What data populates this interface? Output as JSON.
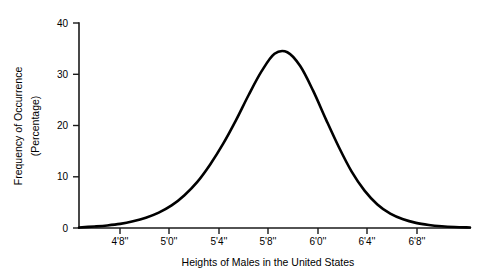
{
  "chart_data": {
    "type": "line",
    "title": "",
    "subtitle": "",
    "xlabel": "Heights of Males in the United States",
    "ylabel": "Frequency of Occurrence (Percentage)",
    "ylabel_lines": [
      "Frequency of Occurrence",
      "(Percentage)"
    ],
    "x_tick_labels": [
      "4'8''",
      "5'0''",
      "5'4''",
      "5'8''",
      "6'0''",
      "6'4''",
      "6'8''"
    ],
    "x_tick_values": [
      56,
      60,
      64,
      68,
      72,
      76,
      80
    ],
    "x_tick_unit": "inches",
    "y_tick_labels": [
      "0",
      "10",
      "20",
      "30",
      "40"
    ],
    "y_tick_values": [
      0,
      10,
      20,
      30,
      40
    ],
    "xlim": [
      52.8,
      83.2
    ],
    "ylim": [
      0,
      40
    ],
    "grid": false,
    "legend": false,
    "legend_position": "none",
    "distribution": "normal",
    "peak_x_label": "5'8''",
    "peak_value": 34.3,
    "series": [
      {
        "name": "Frequency of Occurrence",
        "color": "#000000",
        "x": [
          52.8,
          54,
          55,
          56,
          57,
          58,
          59,
          60,
          61,
          62,
          63,
          64,
          65,
          66,
          67,
          68,
          69,
          70,
          71,
          72,
          73,
          74,
          75,
          76,
          77,
          78,
          79,
          80,
          81,
          82,
          83.2
        ],
        "values": [
          0.1,
          0.3,
          0.5,
          0.8,
          1.3,
          2.0,
          3.0,
          4.4,
          6.4,
          9.0,
          12.4,
          16.4,
          21.0,
          26.0,
          30.6,
          34.0,
          34.3,
          31.6,
          26.8,
          21.2,
          15.8,
          11.0,
          7.3,
          4.6,
          2.8,
          1.7,
          1.0,
          0.6,
          0.35,
          0.2,
          0.1
        ]
      }
    ]
  },
  "axes": {
    "y_axis_name": "frequency-axis",
    "x_axis_name": "height-axis"
  }
}
